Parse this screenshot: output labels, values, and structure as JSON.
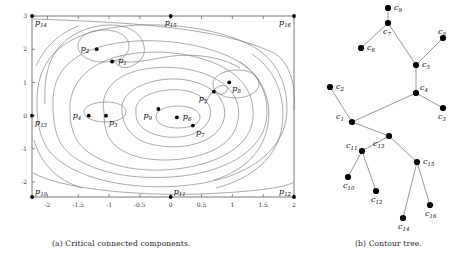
{
  "figure": {
    "panels": [
      {
        "id": "a",
        "caption": "(a) Critical connected components."
      },
      {
        "id": "b",
        "caption": "(b) Contour tree."
      }
    ]
  },
  "chart_data": [
    {
      "type": "contour",
      "title": "Critical connected components.",
      "xlabel": "",
      "ylabel": "",
      "xlim": [
        -2.25,
        2.0
      ],
      "ylim": [
        -2.45,
        3.0
      ],
      "grid": false,
      "legend": "none",
      "xticks": [
        -2,
        -1.5,
        -1,
        -0.5,
        0,
        0.5,
        1,
        1.5,
        2
      ],
      "xticklabels": [
        "-2",
        "-1.5",
        "-1",
        "-0.5",
        "0",
        "0.5",
        "1",
        "1.5",
        "2"
      ],
      "yticks": [
        -2,
        -1,
        0,
        1,
        2,
        3
      ],
      "yticklabels": [
        "-2",
        "-1",
        "0",
        "1",
        "2",
        "3"
      ],
      "points": [
        {
          "label": "p",
          "sub": "1",
          "x": -0.95,
          "y": 1.63,
          "label_pos": "right"
        },
        {
          "label": "p",
          "sub": "2",
          "x": -1.2,
          "y": 2.0,
          "label_pos": "left"
        },
        {
          "label": "p",
          "sub": "3",
          "x": -1.05,
          "y": 0.0,
          "label_pos": "below-right"
        },
        {
          "label": "p",
          "sub": "4",
          "x": -1.33,
          "y": 0.0,
          "label_pos": "left"
        },
        {
          "label": "p",
          "sub": "5",
          "x": 0.7,
          "y": 0.72,
          "label_pos": "below-left"
        },
        {
          "label": "p",
          "sub": "6",
          "x": 0.1,
          "y": -0.05,
          "label_pos": "right"
        },
        {
          "label": "p",
          "sub": "7",
          "x": 0.36,
          "y": -0.3,
          "label_pos": "below-right"
        },
        {
          "label": "p",
          "sub": "8",
          "x": 0.95,
          "y": 1.0,
          "label_pos": "below-right"
        },
        {
          "label": "p",
          "sub": "9",
          "x": -0.2,
          "y": 0.2,
          "label_pos": "below-left"
        },
        {
          "label": "p",
          "sub": "10",
          "x": -2.25,
          "y": -2.45,
          "label_pos": "above-right"
        },
        {
          "label": "p",
          "sub": "11",
          "x": 0.0,
          "y": -2.45,
          "label_pos": "above-right"
        },
        {
          "label": "p",
          "sub": "12",
          "x": 2.0,
          "y": -2.45,
          "label_pos": "above-left"
        },
        {
          "label": "p",
          "sub": "13",
          "x": -2.25,
          "y": 0.0,
          "label_pos": "below-right"
        },
        {
          "label": "p",
          "sub": "14",
          "x": -2.25,
          "y": 3.0,
          "label_pos": "below-right"
        },
        {
          "label": "p",
          "sub": "15",
          "x": 0.0,
          "y": 3.0,
          "label_pos": "below-center"
        },
        {
          "label": "p",
          "sub": "16",
          "x": 2.0,
          "y": 3.0,
          "label_pos": "below-left"
        }
      ],
      "note": "Nested contour level curves of a scalar field with nine interior critical points and seven boundary critical points."
    },
    {
      "type": "tree",
      "title": "Contour tree.",
      "nodes": [
        {
          "id": "c1",
          "label": "c",
          "sub": "1",
          "x": 352,
          "y": 122,
          "label_pos": "above-left"
        },
        {
          "id": "c2",
          "label": "c",
          "sub": "2",
          "x": 330,
          "y": 87,
          "label_pos": "right"
        },
        {
          "id": "c3",
          "label": "c",
          "sub": "3",
          "x": 443,
          "y": 108,
          "label_pos": "below"
        },
        {
          "id": "c4",
          "label": "c",
          "sub": "4",
          "x": 416,
          "y": 93,
          "label_pos": "above-right"
        },
        {
          "id": "c5",
          "label": "c",
          "sub": "5",
          "x": 416,
          "y": 65,
          "label_pos": "right"
        },
        {
          "id": "c6",
          "label": "c",
          "sub": "6",
          "x": 361,
          "y": 48,
          "label_pos": "right"
        },
        {
          "id": "c7",
          "label": "c",
          "sub": "7",
          "x": 388,
          "y": 23,
          "label_pos": "below"
        },
        {
          "id": "c8",
          "label": "c",
          "sub": "8",
          "x": 443,
          "y": 38,
          "label_pos": "above"
        },
        {
          "id": "c9",
          "label": "c",
          "sub": "9",
          "x": 388,
          "y": 8,
          "label_pos": "right"
        },
        {
          "id": "c10",
          "label": "c",
          "sub": "10",
          "x": 348,
          "y": 177,
          "label_pos": "below"
        },
        {
          "id": "c11",
          "label": "c",
          "sub": "11",
          "x": 362,
          "y": 151,
          "label_pos": "above-left"
        },
        {
          "id": "c12",
          "label": "c",
          "sub": "12",
          "x": 376,
          "y": 191,
          "label_pos": "below"
        },
        {
          "id": "c13",
          "label": "c",
          "sub": "13",
          "x": 389,
          "y": 136,
          "label_pos": "below-left"
        },
        {
          "id": "c14",
          "label": "c",
          "sub": "14",
          "x": 403,
          "y": 218,
          "label_pos": "below"
        },
        {
          "id": "c15",
          "label": "c",
          "sub": "15",
          "x": 417,
          "y": 162,
          "label_pos": "right"
        },
        {
          "id": "c16",
          "label": "c",
          "sub": "16",
          "x": 430,
          "y": 205,
          "label_pos": "below"
        }
      ],
      "edges": [
        [
          "c9",
          "c7"
        ],
        [
          "c7",
          "c6"
        ],
        [
          "c7",
          "c5"
        ],
        [
          "c5",
          "c8"
        ],
        [
          "c5",
          "c4"
        ],
        [
          "c4",
          "c3"
        ],
        [
          "c4",
          "c1"
        ],
        [
          "c1",
          "c2"
        ],
        [
          "c1",
          "c13"
        ],
        [
          "c13",
          "c11"
        ],
        [
          "c11",
          "c10"
        ],
        [
          "c11",
          "c12"
        ],
        [
          "c13",
          "c15"
        ],
        [
          "c15",
          "c14"
        ],
        [
          "c15",
          "c16"
        ]
      ]
    }
  ],
  "colors": {
    "contour_line": "#7a7a7a",
    "axis": "#555555",
    "point": "#000000",
    "tree_edge": "#8a8a8a",
    "tree_node": "#000000",
    "text": "#1a1a1a",
    "background": "#ffffff"
  }
}
